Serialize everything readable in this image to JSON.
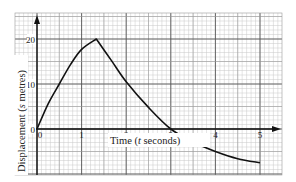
{
  "chart_data": {
    "type": "line",
    "title": "",
    "xlabel": "Time (t seconds)",
    "ylabel": "Displacement (s metres)",
    "xlabel_prefix": "Time (",
    "xlabel_var": "t",
    "xlabel_suffix": " seconds)",
    "ylabel_prefix": "Displacement (",
    "ylabel_var": "s",
    "ylabel_suffix": " metres)",
    "x_ticks": [
      "0",
      "1",
      "2",
      "3",
      "4",
      "5"
    ],
    "y_ticks": [
      "0",
      "10",
      "20"
    ],
    "xlim": [
      -0.5,
      5.5
    ],
    "ylim": [
      -10,
      26
    ],
    "grid": true,
    "legend": null,
    "series": [
      {
        "name": "displacement",
        "x": [
          0,
          0.25,
          0.5,
          0.75,
          1.0,
          1.33,
          1.67,
          2.0,
          2.5,
          3.0,
          3.5,
          4.0,
          4.5,
          5.0
        ],
        "y": [
          0,
          5.6,
          10.0,
          14.3,
          17.7,
          20.0,
          15.2,
          10.5,
          4.8,
          0,
          -2.9,
          -5.0,
          -6.6,
          -7.5
        ]
      }
    ],
    "annotations": [
      "peak at t≈1.33, s=20",
      "crosses zero at t=3"
    ]
  },
  "colors": {
    "paper": "#ffffff",
    "minor_grid": "#c9c9c9",
    "major_grid": "#555555",
    "axis": "#111111",
    "curve": "#111111"
  }
}
